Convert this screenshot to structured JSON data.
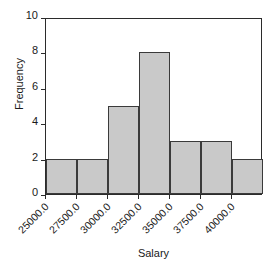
{
  "chart_data": {
    "type": "bar",
    "title": "",
    "subtitle": "",
    "xlabel": "Salary",
    "ylabel": "Frequency",
    "bin_edges": [
      25000.0,
      27500.0,
      30000.0,
      32500.0,
      35000.0,
      37500.0,
      40000.0,
      42500.0
    ],
    "categories": [
      "25000.0",
      "27500.0",
      "30000.0",
      "32500.0",
      "35000.0",
      "37500.0",
      "40000.0"
    ],
    "values": [
      2,
      2,
      5,
      8,
      3,
      3,
      2
    ],
    "xtick_labels": [
      "25000.0",
      "27500.0",
      "30000.0",
      "32500.0",
      "35000.0",
      "37500.0",
      "40000.0"
    ],
    "ytick_labels": [
      "0",
      "2",
      "4",
      "6",
      "8",
      "10"
    ],
    "ytick_values": [
      0,
      2,
      4,
      6,
      8,
      10
    ],
    "ylim": [
      0,
      10
    ],
    "xlim": [
      25000.0,
      42500.0
    ],
    "grid": false,
    "legend": false,
    "legend_position": "none",
    "bar_fill_color": "#c9c9c9",
    "bar_edge_color": "#3a3a3a",
    "axis_color": "#2b2b2b",
    "background_color": "#ffffff"
  }
}
